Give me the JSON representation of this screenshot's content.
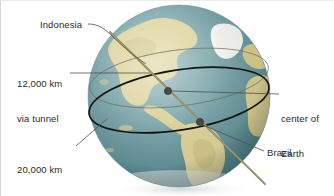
{
  "figure": {
    "background_color": "#ffffff"
  },
  "labels": {
    "indonesia": "Indonesia",
    "tunnel_line1": "12,000 km",
    "tunnel_line2": "via tunnel",
    "circle_line1": "20,000 km",
    "circle_line2": "via circle",
    "center_line1": "center of",
    "center_line2": "Earth",
    "brazil": "Brazil"
  },
  "colors": {
    "ocean_light": "#7fa8ad",
    "ocean_mid": "#5d8d93",
    "ocean_deep": "#3f6f77",
    "land": "#ddd39a",
    "land_dark": "#c3b878",
    "ice": "#f2f2ee",
    "great_circle": "#14140f",
    "tunnel_line": "#8d8a57",
    "leader": "#5a5a5a",
    "text": "#2b2b2b"
  },
  "annotations": {
    "tunnel_distance_km": 12000,
    "circle_distance_km": 20000,
    "endpoint_a": "Indonesia",
    "endpoint_b": "Brazil",
    "center_marker": "center of Earth"
  },
  "globe": {
    "center_x": 179,
    "center_y": 96,
    "radius": 91
  }
}
